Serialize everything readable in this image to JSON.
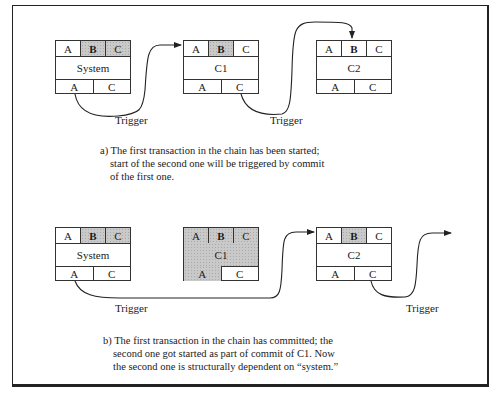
{
  "figure": {
    "panel_a": {
      "boxes": [
        {
          "id": "system",
          "title": "System",
          "top": [
            {
              "label": "A",
              "shaded": false,
              "bold": false
            },
            {
              "label": "B",
              "shaded": true,
              "bold": true
            },
            {
              "label": "C",
              "shaded": true,
              "bold": false
            }
          ],
          "bottom": [
            {
              "label": "A",
              "shaded": false
            },
            {
              "label": "C",
              "shaded": false
            }
          ],
          "title_shaded": false
        },
        {
          "id": "c1",
          "title": "C1",
          "top": [
            {
              "label": "A",
              "shaded": false,
              "bold": false
            },
            {
              "label": "B",
              "shaded": true,
              "bold": true
            },
            {
              "label": "C",
              "shaded": false,
              "bold": false
            }
          ],
          "bottom": [
            {
              "label": "A",
              "shaded": false
            },
            {
              "label": "C",
              "shaded": false
            }
          ],
          "title_shaded": false
        },
        {
          "id": "c2",
          "title": "C2",
          "top": [
            {
              "label": "A",
              "shaded": false,
              "bold": false
            },
            {
              "label": "B",
              "shaded": false,
              "bold": true
            },
            {
              "label": "C",
              "shaded": false,
              "bold": false
            }
          ],
          "bottom": [
            {
              "label": "A",
              "shaded": false
            },
            {
              "label": "C",
              "shaded": false
            }
          ],
          "title_shaded": false
        }
      ],
      "trigger_labels": [
        "Trigger",
        "Trigger"
      ],
      "caption_lines": [
        "a) The first transaction in the chain has been started;",
        "start of the second one will be triggered by commit",
        "of the first one."
      ]
    },
    "panel_b": {
      "boxes": [
        {
          "id": "system",
          "title": "System",
          "top": [
            {
              "label": "A",
              "shaded": false,
              "bold": false
            },
            {
              "label": "B",
              "shaded": true,
              "bold": true
            },
            {
              "label": "C",
              "shaded": true,
              "bold": false
            }
          ],
          "bottom": [
            {
              "label": "A",
              "shaded": false
            },
            {
              "label": "C",
              "shaded": false
            }
          ],
          "title_shaded": false
        },
        {
          "id": "c1",
          "title": "C1",
          "top": [
            {
              "label": "A",
              "shaded": true,
              "bold": false
            },
            {
              "label": "B",
              "shaded": true,
              "bold": true
            },
            {
              "label": "C",
              "shaded": true,
              "bold": false
            }
          ],
          "bottom": [
            {
              "label": "A",
              "shaded": true
            },
            {
              "label": "C",
              "shaded": false
            }
          ],
          "title_shaded": true
        },
        {
          "id": "c2",
          "title": "C2",
          "top": [
            {
              "label": "A",
              "shaded": false,
              "bold": false
            },
            {
              "label": "B",
              "shaded": true,
              "bold": true
            },
            {
              "label": "C",
              "shaded": false,
              "bold": false
            }
          ],
          "bottom": [
            {
              "label": "A",
              "shaded": false
            },
            {
              "label": "C",
              "shaded": false
            }
          ],
          "title_shaded": false
        }
      ],
      "trigger_labels": [
        "Trigger",
        "Trigger"
      ],
      "caption_lines": [
        "b) The first transaction in the chain has committed; the",
        "second one got started as part of commit of C1. Now",
        "the second one is structurally dependent on “system.”"
      ]
    },
    "colors": {
      "line": "#222222",
      "shade": "#c9c9c9",
      "background": "#ffffff"
    }
  }
}
